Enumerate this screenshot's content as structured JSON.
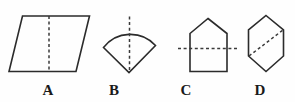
{
  "figure": {
    "width": 295,
    "height": 102,
    "background_color": "#fefefe",
    "stroke_color": "#2b2b2b",
    "dash_color": "#3a3a3a",
    "label_color": "#1a1a1a"
  },
  "shapes": [
    {
      "id": "A",
      "label": "A",
      "name": "parallelogram",
      "label_x": 38,
      "outline_points": "22.5,16 89.5,16 76,71.5 9,71.5",
      "dash_path": "M 49,16 L 49,71.5",
      "dash_orientation": "vertical"
    },
    {
      "id": "B",
      "label": "B",
      "name": "circular-sector",
      "label_x": 104,
      "outline_path": "M 103.5,47.5 A 34,34 0 0 1 155.5,45.5 L 129,72.5 Z",
      "dash_path": "M 129.5,16.5 L 129.5,72.5",
      "dash_orientation": "vertical"
    },
    {
      "id": "C",
      "label": "C",
      "name": "pentagon-house",
      "label_x": 176,
      "outline_points": "208,18.5 227,33.5 227,71.5 190,71.5 190,33.5",
      "dash_path": "M 178,48.5 L 238,48.5",
      "dash_orientation": "horizontal"
    },
    {
      "id": "D",
      "label": "D",
      "name": "hexagon",
      "label_x": 250,
      "outline_points": "266,15.5 283.5,30 283.5,56 266,71.5 248.5,56 248.5,30",
      "dash_path": "M 249,56 L 283,30",
      "dash_orientation": "diagonal"
    }
  ]
}
